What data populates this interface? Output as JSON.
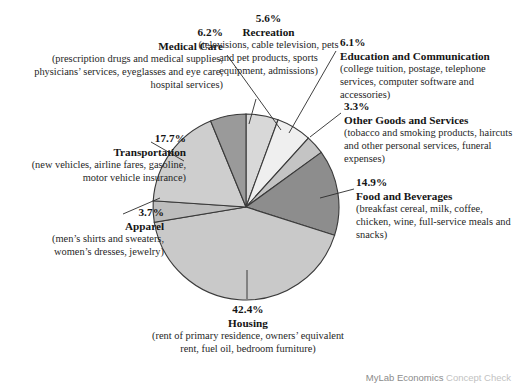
{
  "footer": {
    "brand": "MyLab Economics",
    "suffix": "Concept Check"
  },
  "chart_data": {
    "type": "pie",
    "title": "",
    "legend_position": "callouts",
    "grid": false,
    "center": {
      "x": 246,
      "y": 207,
      "radius": 93
    },
    "start_angle_deg": -90,
    "categories": [
      "Recreation",
      "Education and Communication",
      "Other Goods and Services",
      "Food and Beverages",
      "Housing",
      "Apparel",
      "Transportation",
      "Medical Care"
    ],
    "values": [
      5.6,
      6.1,
      3.3,
      14.9,
      42.4,
      3.7,
      17.7,
      6.2
    ],
    "slices": [
      {
        "name": "Recreation",
        "percent_label": "5.6%",
        "value": 5.6,
        "color": "#d8d8d8",
        "detail": "(televisions, cable television, pets and pet products, sports equipment, admissions)"
      },
      {
        "name": "Education and Communication",
        "percent_label": "6.1%",
        "value": 6.1,
        "color": "#efefef",
        "detail": "(college tuition, postage, telephone services, computer software and accessories)"
      },
      {
        "name": "Other Goods and Services",
        "percent_label": "3.3%",
        "value": 3.3,
        "color": "#c4c4c4",
        "detail": "(tobacco and smoking products, haircuts and other personal services, funeral expenses)"
      },
      {
        "name": "Food and Beverages",
        "percent_label": "14.9%",
        "value": 14.9,
        "color": "#8d8d8d",
        "detail": "(breakfast cereal, milk, coffee, chicken, wine, full-service meals and snacks)"
      },
      {
        "name": "Housing",
        "percent_label": "42.4%",
        "value": 42.4,
        "color": "#c9c9c9",
        "detail": "(rent of primary residence, owners’ equivalent rent, fuel oil, bedroom furniture)"
      },
      {
        "name": "Apparel",
        "percent_label": "3.7%",
        "value": 3.7,
        "color": "#bdbdbd",
        "detail": "(men’s shirts and sweaters, women’s dresses, jewelry)"
      },
      {
        "name": "Transportation",
        "percent_label": "17.7%",
        "value": 17.7,
        "color": "#cecece",
        "detail": "(new vehicles, airline fares, gasoline, motor vehicle insurance)"
      },
      {
        "name": "Medical Care",
        "percent_label": "6.2%",
        "value": 6.2,
        "color": "#9a9a9a",
        "detail": "(prescription drugs and medical supplies, physicians’ services, eyeglasses and eye care, hospital services)"
      }
    ]
  }
}
